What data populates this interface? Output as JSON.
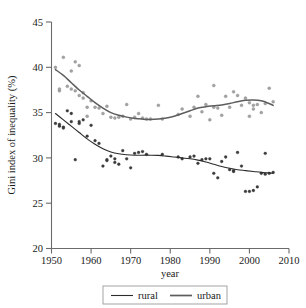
{
  "chart_data": {
    "type": "scatter",
    "title": "",
    "xlabel": "year",
    "ylabel": "Gini index of inequality (%)",
    "xlim": [
      1950,
      2010
    ],
    "ylim": [
      20,
      45
    ],
    "xticks": [
      1950,
      1960,
      1970,
      1980,
      1990,
      2000,
      2010
    ],
    "yticks": [
      20,
      25,
      30,
      35,
      40,
      45
    ],
    "grid": false,
    "legend_position": "below-axes",
    "legend": [
      "rural",
      "urban"
    ],
    "colors": {
      "urban_points": "#a3a3a3",
      "rural_points": "#3a3a3a",
      "urban_line": "#5d5d5d",
      "rural_line": "#2b2b2b",
      "axis": "#6b6b6b"
    },
    "series": [
      {
        "name": "urban",
        "marker": "open-circle",
        "points": [
          [
            1951,
            40.0
          ],
          [
            1952,
            37.4
          ],
          [
            1952,
            37.6
          ],
          [
            1953,
            41.1
          ],
          [
            1954,
            37.9
          ],
          [
            1955,
            39.6
          ],
          [
            1955,
            37.6
          ],
          [
            1956,
            37.4
          ],
          [
            1956,
            40.6
          ],
          [
            1957,
            40.2
          ],
          [
            1957,
            36.9
          ],
          [
            1958,
            36.6
          ],
          [
            1958,
            37.2
          ],
          [
            1959,
            34.6
          ],
          [
            1959,
            35.6
          ],
          [
            1960,
            36.3
          ],
          [
            1961,
            35.6
          ],
          [
            1962,
            35.5
          ],
          [
            1963,
            34.9
          ],
          [
            1964,
            35.7
          ],
          [
            1965,
            34.5
          ],
          [
            1966,
            34.4
          ],
          [
            1967,
            34.5
          ],
          [
            1968,
            34.6
          ],
          [
            1969,
            35.9
          ],
          [
            1970,
            34.3
          ],
          [
            1971,
            34.5
          ],
          [
            1972,
            34.9
          ],
          [
            1973,
            34.4
          ],
          [
            1974,
            34.3
          ],
          [
            1975,
            34.3
          ],
          [
            1977,
            35.8
          ],
          [
            1978,
            34.3
          ],
          [
            1982,
            34.8
          ],
          [
            1983,
            35.4
          ],
          [
            1985,
            34.6
          ],
          [
            1986,
            35.6
          ],
          [
            1987,
            36.8
          ],
          [
            1988,
            35.1
          ],
          [
            1989,
            35.9
          ],
          [
            1990,
            34.2
          ],
          [
            1991,
            38.0
          ],
          [
            1991,
            35.6
          ],
          [
            1992,
            35.5
          ],
          [
            1993,
            34.7
          ],
          [
            1994,
            36.8
          ],
          [
            1995,
            35.6
          ],
          [
            1996,
            37.3
          ],
          [
            1997,
            36.9
          ],
          [
            1998,
            35.8
          ],
          [
            1999,
            36.6
          ],
          [
            2000,
            34.6
          ],
          [
            2000,
            36.1
          ],
          [
            2001,
            35.8
          ],
          [
            2001,
            35.4
          ],
          [
            2002,
            35.9
          ],
          [
            2003,
            35.0
          ],
          [
            2004,
            36.0
          ],
          [
            2005,
            37.7
          ],
          [
            2006,
            36.2
          ]
        ]
      },
      {
        "name": "rural",
        "marker": "filled-circle",
        "points": [
          [
            1951,
            33.8
          ],
          [
            1952,
            33.5
          ],
          [
            1952,
            33.7
          ],
          [
            1953,
            33.4
          ],
          [
            1953,
            33.3
          ],
          [
            1954,
            35.2
          ],
          [
            1955,
            34.0
          ],
          [
            1955,
            34.9
          ],
          [
            1956,
            29.8
          ],
          [
            1957,
            33.8
          ],
          [
            1957,
            34.0
          ],
          [
            1958,
            34.2
          ],
          [
            1959,
            32.4
          ],
          [
            1960,
            33.6
          ],
          [
            1961,
            31.9
          ],
          [
            1962,
            31.6
          ],
          [
            1963,
            29.1
          ],
          [
            1964,
            29.7
          ],
          [
            1964,
            29.8
          ],
          [
            1965,
            30.2
          ],
          [
            1966,
            29.5
          ],
          [
            1966,
            29.9
          ],
          [
            1967,
            29.3
          ],
          [
            1968,
            30.8
          ],
          [
            1969,
            29.9
          ],
          [
            1970,
            28.9
          ],
          [
            1971,
            30.5
          ],
          [
            1972,
            30.6
          ],
          [
            1973,
            30.7
          ],
          [
            1974,
            30.4
          ],
          [
            1978,
            30.4
          ],
          [
            1982,
            30.1
          ],
          [
            1983,
            29.9
          ],
          [
            1985,
            30.1
          ],
          [
            1986,
            30.2
          ],
          [
            1987,
            29.4
          ],
          [
            1988,
            29.8
          ],
          [
            1989,
            29.9
          ],
          [
            1990,
            29.9
          ],
          [
            1991,
            28.3
          ],
          [
            1992,
            27.8
          ],
          [
            1993,
            29.6
          ],
          [
            1994,
            30.1
          ],
          [
            1995,
            28.7
          ],
          [
            1996,
            28.5
          ],
          [
            1996,
            28.6
          ],
          [
            1997,
            30.6
          ],
          [
            1998,
            29.1
          ],
          [
            1999,
            26.3
          ],
          [
            2000,
            26.3
          ],
          [
            2001,
            26.4
          ],
          [
            2002,
            26.8
          ],
          [
            2003,
            28.3
          ],
          [
            2004,
            28.2
          ],
          [
            2004,
            30.5
          ],
          [
            2005,
            28.3
          ],
          [
            2006,
            28.4
          ]
        ]
      }
    ],
    "trend_lines": [
      {
        "name": "urban",
        "points": [
          [
            1951,
            39.75
          ],
          [
            1953,
            39.1
          ],
          [
            1955,
            38.3
          ],
          [
            1957,
            37.5
          ],
          [
            1959,
            36.8
          ],
          [
            1961,
            36.1
          ],
          [
            1963,
            35.5
          ],
          [
            1965,
            35.0
          ],
          [
            1967,
            34.7
          ],
          [
            1969,
            34.5
          ],
          [
            1971,
            34.35
          ],
          [
            1973,
            34.28
          ],
          [
            1975,
            34.25
          ],
          [
            1977,
            34.3
          ],
          [
            1979,
            34.4
          ],
          [
            1981,
            34.6
          ],
          [
            1983,
            34.9
          ],
          [
            1985,
            35.2
          ],
          [
            1987,
            35.5
          ],
          [
            1989,
            35.65
          ],
          [
            1991,
            35.75
          ],
          [
            1993,
            35.85
          ],
          [
            1995,
            36.0
          ],
          [
            1997,
            36.2
          ],
          [
            1999,
            36.35
          ],
          [
            2001,
            36.4
          ],
          [
            2003,
            36.3
          ],
          [
            2005,
            36.0
          ],
          [
            2006,
            35.8
          ]
        ]
      },
      {
        "name": "rural",
        "points": [
          [
            1951,
            34.9
          ],
          [
            1953,
            34.2
          ],
          [
            1955,
            33.5
          ],
          [
            1957,
            32.8
          ],
          [
            1959,
            32.1
          ],
          [
            1961,
            31.5
          ],
          [
            1963,
            31.0
          ],
          [
            1965,
            30.65
          ],
          [
            1967,
            30.45
          ],
          [
            1969,
            30.35
          ],
          [
            1971,
            30.3
          ],
          [
            1973,
            30.3
          ],
          [
            1975,
            30.3
          ],
          [
            1977,
            30.28
          ],
          [
            1979,
            30.2
          ],
          [
            1981,
            30.1
          ],
          [
            1983,
            30.0
          ],
          [
            1985,
            29.9
          ],
          [
            1987,
            29.75
          ],
          [
            1989,
            29.55
          ],
          [
            1991,
            29.3
          ],
          [
            1993,
            29.05
          ],
          [
            1995,
            28.85
          ],
          [
            1997,
            28.7
          ],
          [
            1999,
            28.6
          ],
          [
            2001,
            28.5
          ],
          [
            2003,
            28.4
          ],
          [
            2005,
            28.35
          ],
          [
            2006,
            28.3
          ]
        ]
      }
    ]
  },
  "legend": {
    "items": [
      {
        "label": "rural",
        "style": "thin-dark-line"
      },
      {
        "label": "urban",
        "style": "thick-gray-line"
      }
    ]
  },
  "axes": {
    "x_title": "year",
    "y_title": "Gini index of inequality (%)",
    "x_tick_labels": [
      "1950",
      "1960",
      "1970",
      "1980",
      "1990",
      "2000",
      "2010"
    ],
    "y_tick_labels": [
      "20",
      "25",
      "30",
      "35",
      "40",
      "45"
    ]
  }
}
